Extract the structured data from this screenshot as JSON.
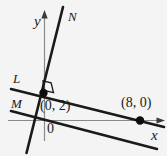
{
  "figure": {
    "kind": "coordinate-geometry-diagram",
    "background_color": "#f4f4f4",
    "ink_color": "#1a1a1a",
    "axis_color": "#777777",
    "width": 167,
    "height": 156,
    "axes": {
      "y_axis_label": "y",
      "x_axis_label": "x",
      "origin_label": "0"
    },
    "lines": [
      {
        "id": "L",
        "label": "L",
        "description": "line through (0, 2) with gentle negative slope passing through (8, 0)"
      },
      {
        "id": "M",
        "label": "M",
        "description": "line parallel to L, below it"
      },
      {
        "id": "N",
        "label": "N",
        "description": "steep line perpendicular to L through (0, 2)"
      }
    ],
    "points": [
      {
        "label": "(0, 2)",
        "x": 0,
        "y": 2
      },
      {
        "label": "(8, 0)",
        "x": 8,
        "y": 0
      }
    ],
    "markers": [
      {
        "type": "right-angle",
        "at": "intersection of L and N"
      }
    ]
  }
}
